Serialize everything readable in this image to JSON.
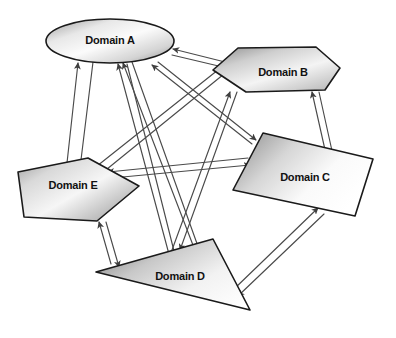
{
  "diagram": {
    "background_color": "#ffffff",
    "line_color": "#4a4a4a",
    "outline_color": "#1a1a1a",
    "label_color": "#111111",
    "gradient_light": "#f7f7f7",
    "gradient_mid": "#d2d2d2",
    "gradient_dark": "#8f8f8f",
    "nodes": [
      {
        "id": "domain-a",
        "label": "Domain A",
        "shape": "ellipse",
        "label_x": 110,
        "label_y": 41,
        "geometry": {
          "cx": 110,
          "cy": 41,
          "rx": 64,
          "ry": 22
        }
      },
      {
        "id": "domain-b",
        "label": "Domain B",
        "shape": "hexagon",
        "label_x": 283,
        "label_y": 73,
        "geometry": {
          "points": "238,48 316,47 340,68 325,90 246,92 213,70"
        }
      },
      {
        "id": "domain-c",
        "label": "Domain C",
        "shape": "parallelogram",
        "label_x": 305,
        "label_y": 178,
        "geometry": {
          "points": "263,133 373,159 355,216 233,190"
        }
      },
      {
        "id": "domain-d",
        "label": "Domain D",
        "shape": "triangle",
        "label_x": 180,
        "label_y": 277,
        "geometry": {
          "points": "96,272 213,239 250,310"
        }
      },
      {
        "id": "domain-e",
        "label": "Domain E",
        "shape": "arrow-pentagon",
        "label_x": 73,
        "label_y": 186,
        "geometry": {
          "points": "18,172 88,158 139,186 97,221 24,217"
        }
      }
    ],
    "edges": [
      {
        "id": "edge-e-a",
        "from": "domain-e",
        "to": "domain-a",
        "direction": "bidirectional"
      },
      {
        "id": "edge-a-e",
        "from": "domain-a",
        "to": "domain-e",
        "direction": "bidirectional"
      },
      {
        "id": "edge-d-a",
        "from": "domain-d",
        "to": "domain-a",
        "direction": "bidirectional"
      },
      {
        "id": "edge-a-d",
        "from": "domain-a",
        "to": "domain-d",
        "direction": "bidirectional"
      },
      {
        "id": "edge-c-a",
        "from": "domain-c",
        "to": "domain-a",
        "direction": "bidirectional"
      },
      {
        "id": "edge-b-a",
        "from": "domain-b",
        "to": "domain-a",
        "direction": "bidirectional"
      },
      {
        "id": "edge-e-b",
        "from": "domain-e",
        "to": "domain-b",
        "direction": "bidirectional"
      },
      {
        "id": "edge-d-b",
        "from": "domain-d",
        "to": "domain-b",
        "direction": "bidirectional"
      },
      {
        "id": "edge-b-c",
        "from": "domain-b",
        "to": "domain-c",
        "direction": "bidirectional"
      },
      {
        "id": "edge-e-c",
        "from": "domain-e",
        "to": "domain-c",
        "direction": "bidirectional"
      },
      {
        "id": "edge-d-c",
        "from": "domain-d",
        "to": "domain-c",
        "direction": "bidirectional"
      },
      {
        "id": "edge-e-d",
        "from": "domain-e",
        "to": "domain-d",
        "direction": "bidirectional"
      }
    ]
  }
}
